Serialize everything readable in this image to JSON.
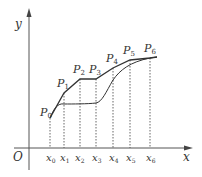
{
  "diagram": {
    "axes": {
      "x_label": "x",
      "y_label": "y",
      "origin_label": "O"
    },
    "x_ticks": [
      {
        "label": "x",
        "sub": "0",
        "px": 50
      },
      {
        "label": "x",
        "sub": "1",
        "px": 64
      },
      {
        "label": "x",
        "sub": "2",
        "px": 79
      },
      {
        "label": "x",
        "sub": "3",
        "px": 96
      },
      {
        "label": "x",
        "sub": "4",
        "px": 113
      },
      {
        "label": "x",
        "sub": "5",
        "px": 130
      },
      {
        "label": "x",
        "sub": "6",
        "px": 150
      }
    ],
    "points": [
      {
        "label": "P",
        "sub": "0",
        "px": 50,
        "py": 118
      },
      {
        "label": "P",
        "sub": "1",
        "px": 64,
        "py": 93
      },
      {
        "label": "P",
        "sub": "2",
        "px": 80,
        "py": 79
      },
      {
        "label": "P",
        "sub": "3",
        "px": 96,
        "py": 79
      },
      {
        "label": "P",
        "sub": "4",
        "px": 113,
        "py": 68
      },
      {
        "label": "P",
        "sub": "5",
        "px": 130,
        "py": 60
      },
      {
        "label": "P",
        "sub": "6",
        "px": 150,
        "py": 58
      }
    ],
    "colors": {
      "stroke": "#333333",
      "dashed": "#555555"
    }
  }
}
